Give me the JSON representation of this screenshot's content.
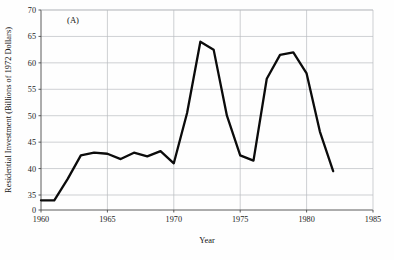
{
  "chart_data": {
    "type": "line",
    "title": "",
    "panel_label": "(A)",
    "xlabel": "Year",
    "ylabel": "Residential Investment (Billions of 1972 Dollars)",
    "x": [
      1960,
      1961,
      1962,
      1963,
      1964,
      1965,
      1966,
      1967,
      1968,
      1969,
      1970,
      1971,
      1972,
      1973,
      1974,
      1975,
      1976,
      1977,
      1978,
      1979,
      1980,
      1981,
      1982
    ],
    "values": [
      34.0,
      34.0,
      38.0,
      42.5,
      43.0,
      42.8,
      41.8,
      43.0,
      42.3,
      43.3,
      41.0,
      50.5,
      64.0,
      62.5,
      50.0,
      42.5,
      41.5,
      57.0,
      61.5,
      62.0,
      58.0,
      47.0,
      39.5
    ],
    "series": [
      {
        "name": "Residential Investment",
        "values": [
          34.0,
          34.0,
          38.0,
          42.5,
          43.0,
          42.8,
          41.8,
          43.0,
          42.3,
          43.3,
          41.0,
          50.5,
          64.0,
          62.5,
          50.0,
          42.5,
          41.5,
          57.0,
          61.5,
          62.0,
          58.0,
          47.0,
          39.5
        ]
      }
    ],
    "xlim": [
      1960,
      1985
    ],
    "ylim": [
      35,
      70
    ],
    "y_axis_broken_at_zero": true,
    "xticks": [
      1960,
      1965,
      1970,
      1975,
      1980,
      1985
    ],
    "xtick_labels": [
      "1960",
      "1965",
      "1970",
      "1975",
      "1980",
      "1985"
    ],
    "yticks": [
      0,
      35,
      40,
      45,
      50,
      55,
      60,
      65,
      70
    ],
    "ytick_labels": [
      "0",
      "35",
      "40",
      "45",
      "50",
      "55",
      "60",
      "65",
      "70"
    ],
    "grid": true,
    "grid_color": "#b9bcc0",
    "line_color": "#0b0b0b",
    "legend": "none"
  }
}
